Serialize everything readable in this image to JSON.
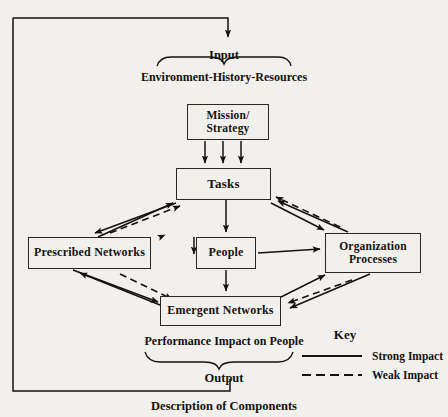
{
  "figure": {
    "caption": "Description of Components",
    "input_label": "Input",
    "input_group": "Environment-History-Resources",
    "output_label": "Output",
    "output_group": "Performance Impact on People"
  },
  "nodes": [
    {
      "id": "mission",
      "label": "Mission/\nStrategy"
    },
    {
      "id": "tasks",
      "label": "Tasks"
    },
    {
      "id": "prescribed",
      "label": "Prescribed Networks"
    },
    {
      "id": "people",
      "label": "People"
    },
    {
      "id": "orgproc",
      "label": "Organization\nProcesses"
    },
    {
      "id": "emergent",
      "label": "Emergent Networks"
    }
  ],
  "node_labels": {
    "mission_line1": "Mission/",
    "mission_line2": "Strategy",
    "tasks": "Tasks",
    "prescribed": "Prescribed Networks",
    "people": "People",
    "orgproc_line1": "Organization",
    "orgproc_line2": "Processes",
    "emergent": "Emergent Networks"
  },
  "key": {
    "title": "Key",
    "entries": [
      {
        "label": "Strong Impact",
        "style": "solid"
      },
      {
        "label": "Weak Impact",
        "style": "dashed"
      }
    ]
  },
  "colors": {
    "ink": "#15120f",
    "line": "#2a2622",
    "page": "#f2f0ec"
  }
}
